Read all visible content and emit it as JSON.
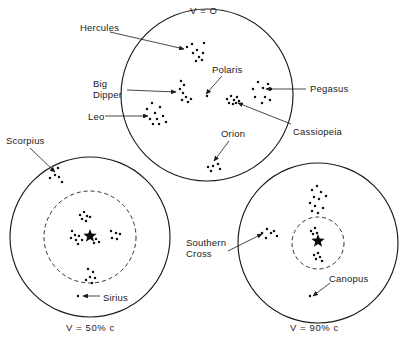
{
  "figure": {
    "background_color": "#ffffff",
    "ink_color": "#1b1b1b"
  },
  "panels": [
    {
      "id": "rest-frame",
      "caption": "V = O",
      "caption_position": "top",
      "center": [
        207,
        95
      ],
      "radius": 86,
      "has_aberration_ring": false
    },
    {
      "id": "half-c",
      "caption": "V = 50% c",
      "caption_position": "bottom",
      "center": [
        90,
        237
      ],
      "radius": 80,
      "has_aberration_ring": true,
      "ring_radius": 46
    },
    {
      "id": "ninety-c",
      "caption": "V = 90% c",
      "caption_position": "bottom",
      "center": [
        318,
        243
      ],
      "radius": 80,
      "has_aberration_ring": true,
      "ring_radius": 26
    }
  ],
  "labels": [
    {
      "id": "v-zero",
      "text": "V = O",
      "x": 190,
      "y": 5,
      "panel": "rest-frame"
    },
    {
      "id": "hercules",
      "text": "Hercules",
      "x": 80,
      "y": 22,
      "panel": "rest-frame"
    },
    {
      "id": "big-dipper",
      "text": "Big\nDipper",
      "x": 93,
      "y": 78,
      "panel": "rest-frame"
    },
    {
      "id": "leo",
      "text": "Leo",
      "x": 88,
      "y": 111,
      "panel": "rest-frame"
    },
    {
      "id": "polaris",
      "text": "Polaris",
      "x": 212,
      "y": 64,
      "panel": "rest-frame"
    },
    {
      "id": "pegasus",
      "text": "Pegasus",
      "x": 310,
      "y": 83,
      "panel": "rest-frame"
    },
    {
      "id": "cassiopeia",
      "text": "Cassiopeia",
      "x": 293,
      "y": 126,
      "panel": "rest-frame"
    },
    {
      "id": "orion",
      "text": "Orion",
      "x": 221,
      "y": 128,
      "panel": "rest-frame"
    },
    {
      "id": "scorpius",
      "text": "Scorpius",
      "x": 6,
      "y": 135,
      "panel": "half-c"
    },
    {
      "id": "sirius",
      "text": "Sirius",
      "x": 103,
      "y": 292,
      "panel": "half-c"
    },
    {
      "id": "v-fifty",
      "text": "V = 50% c",
      "x": 66,
      "y": 322,
      "panel": "half-c"
    },
    {
      "id": "southern-cross",
      "text": "Southern\nCross",
      "x": 186,
      "y": 237,
      "panel": "ninety-c"
    },
    {
      "id": "canopus",
      "text": "Canopus",
      "x": 329,
      "y": 273,
      "panel": "ninety-c"
    },
    {
      "id": "v-ninety",
      "text": "V = 90% c",
      "x": 290,
      "y": 322,
      "panel": "ninety-c"
    }
  ],
  "leaders": [
    {
      "id": "leader-hercules",
      "from": [
        110,
        32
      ],
      "to": [
        184,
        49
      ],
      "arrow": true
    },
    {
      "id": "leader-big-dipper",
      "from": [
        127,
        90
      ],
      "to": [
        176,
        92
      ],
      "arrow": true
    },
    {
      "id": "leader-leo",
      "from": [
        105,
        116
      ],
      "to": [
        148,
        116
      ],
      "arrow": true
    },
    {
      "id": "leader-polaris",
      "from": [
        222,
        76
      ],
      "to": [
        206,
        94
      ],
      "arrow": true
    },
    {
      "id": "leader-pegasus",
      "from": [
        306,
        89
      ],
      "to": [
        266,
        89
      ],
      "arrow": true
    },
    {
      "id": "leader-cassiopeia",
      "from": [
        291,
        124
      ],
      "to": [
        238,
        103
      ],
      "arrow": true
    },
    {
      "id": "leader-orion",
      "from": [
        229,
        141
      ],
      "to": [
        214,
        161
      ],
      "arrow": true
    },
    {
      "id": "leader-scorpius",
      "from": [
        30,
        148
      ],
      "to": [
        55,
        172
      ],
      "arrow": true
    },
    {
      "id": "leader-sirius",
      "from": [
        100,
        296
      ],
      "to": [
        83,
        296
      ],
      "arrow": true
    },
    {
      "id": "leader-southern",
      "from": [
        228,
        251
      ],
      "to": [
        262,
        234
      ],
      "arrow": true
    },
    {
      "id": "leader-canopus",
      "from": [
        330,
        283
      ],
      "to": [
        313,
        296
      ],
      "arrow": true
    }
  ],
  "star_fields": {
    "rest-frame": [
      {
        "name": "Hercules",
        "stars": [
          [
            187,
            47
          ],
          [
            192,
            44
          ],
          [
            197,
            50
          ],
          [
            204,
            43
          ],
          [
            193,
            53
          ],
          [
            199,
            57
          ],
          [
            203,
            53
          ],
          [
            196,
            61
          ],
          [
            202,
            60
          ]
        ]
      },
      {
        "name": "Big Dipper",
        "stars": [
          [
            181,
            81
          ],
          [
            184,
            85
          ],
          [
            180,
            89
          ],
          [
            183,
            93
          ],
          [
            186,
            97
          ],
          [
            182,
            100
          ],
          [
            188,
            102
          ],
          [
            191,
            99
          ]
        ]
      },
      {
        "name": "Leo",
        "stars": [
          [
            152,
            103
          ],
          [
            147,
            109
          ],
          [
            160,
            107
          ],
          [
            155,
            113
          ],
          [
            150,
            119
          ],
          [
            157,
            119
          ],
          [
            163,
            116
          ],
          [
            166,
            122
          ],
          [
            159,
            124
          ],
          [
            153,
            124
          ]
        ]
      },
      {
        "name": "Polaris",
        "stars": [
          [
            207,
            96
          ]
        ]
      },
      {
        "name": "Cassiopeia",
        "stars": [
          [
            227,
            99
          ],
          [
            231,
            96
          ],
          [
            234,
            100
          ],
          [
            237,
            97
          ],
          [
            229,
            103
          ],
          [
            233,
            104
          ],
          [
            236,
            103
          ],
          [
            239,
            101
          ]
        ]
      },
      {
        "name": "Pegasus",
        "stars": [
          [
            253,
            89
          ],
          [
            258,
            82
          ],
          [
            263,
            88
          ],
          [
            268,
            84
          ],
          [
            271,
            89
          ],
          [
            255,
            97
          ],
          [
            265,
            97
          ],
          [
            262,
            103
          ],
          [
            270,
            100
          ]
        ]
      },
      {
        "name": "Orion",
        "stars": [
          [
            208,
            167
          ],
          [
            213,
            166
          ],
          [
            218,
            164
          ],
          [
            211,
            171
          ],
          [
            220,
            169
          ]
        ]
      }
    ],
    "half-c": [
      {
        "name": "Scorpius",
        "stars": [
          [
            52,
            170
          ],
          [
            58,
            168
          ],
          [
            55,
            175
          ],
          [
            50,
            178
          ],
          [
            59,
            177
          ],
          [
            62,
            182
          ]
        ]
      },
      {
        "name": "upper cluster",
        "stars": [
          [
            80,
            215
          ],
          [
            84,
            212
          ],
          [
            87,
            216
          ],
          [
            82,
            219
          ],
          [
            86,
            221
          ],
          [
            90,
            217
          ]
        ]
      },
      {
        "name": "left group",
        "stars": [
          [
            72,
            231
          ],
          [
            75,
            235
          ],
          [
            71,
            238
          ],
          [
            76,
            240
          ],
          [
            79,
            236
          ],
          [
            82,
            240
          ],
          [
            78,
            244
          ]
        ]
      },
      {
        "name": "Polaris bright",
        "stars": [
          [
            90,
            236
          ]
        ]
      },
      {
        "name": "right group",
        "stars": [
          [
            111,
            231
          ],
          [
            116,
            233
          ],
          [
            112,
            238
          ],
          [
            117,
            239
          ],
          [
            120,
            234
          ]
        ]
      },
      {
        "name": "near-center small",
        "stars": [
          [
            96,
            239
          ],
          [
            99,
            242
          ],
          [
            94,
            243
          ]
        ]
      },
      {
        "name": "lower cluster",
        "stars": [
          [
            88,
            269
          ],
          [
            93,
            272
          ],
          [
            90,
            277
          ],
          [
            95,
            278
          ],
          [
            86,
            280
          ],
          [
            92,
            283
          ]
        ]
      },
      {
        "name": "Sirius",
        "stars": [
          [
            78,
            296
          ]
        ]
      }
    ],
    "ninety-c": [
      {
        "name": "upper chain",
        "stars": [
          [
            312,
            190
          ],
          [
            317,
            186
          ],
          [
            321,
            192
          ],
          [
            314,
            197
          ],
          [
            319,
            199
          ],
          [
            310,
            203
          ],
          [
            315,
            206
          ],
          [
            312,
            211
          ],
          [
            318,
            213
          ],
          [
            323,
            208
          ],
          [
            326,
            196
          ]
        ]
      },
      {
        "name": "Southern Cross",
        "stars": [
          [
            262,
            233
          ],
          [
            267,
            229
          ],
          [
            271,
            233
          ],
          [
            266,
            238
          ],
          [
            274,
            231
          ],
          [
            277,
            236
          ]
        ]
      },
      {
        "name": "inner cluster upper",
        "stars": [
          [
            311,
            231
          ],
          [
            315,
            228
          ],
          [
            313,
            234
          ],
          [
            317,
            233
          ]
        ]
      },
      {
        "name": "Polaris bright",
        "stars": [
          [
            318,
            241
          ]
        ]
      },
      {
        "name": "inner cluster lower",
        "stars": [
          [
            314,
            255
          ],
          [
            318,
            253
          ],
          [
            316,
            259
          ],
          [
            320,
            257
          ],
          [
            322,
            261
          ]
        ]
      },
      {
        "name": "Canopus",
        "stars": [
          [
            310,
            296
          ]
        ]
      }
    ]
  }
}
